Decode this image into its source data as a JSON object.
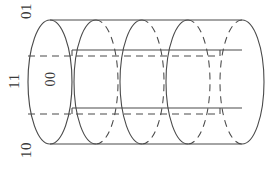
{
  "figure": {
    "kind": "line-drawing",
    "background_color": "#ffffff",
    "stroke_color": "#4a4a4a",
    "label_color": "#3a3a3a"
  },
  "labels": {
    "top_left": "01",
    "middle_left": "11",
    "bottom_left": "10",
    "inside_front_face": "00"
  },
  "geometry": {
    "canvas_width": 269,
    "canvas_height": 172,
    "cylinder_left_x": 50,
    "cylinder_right_x": 242,
    "ellipse_rx": 22,
    "ellipse_ry": 62,
    "center_y": 82,
    "ellipse_centers_x": [
      50,
      96,
      142,
      188,
      242
    ],
    "top_outline_y": 20,
    "bottom_outline_y": 144,
    "upper_band_solid_y": 50,
    "upper_band_dashed_y": 56,
    "lower_band_solid_y": 108,
    "lower_band_dashed_y": 114
  }
}
